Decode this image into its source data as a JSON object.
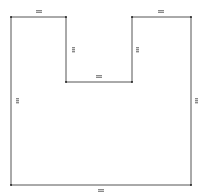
{
  "diagram": {
    "type": "floor-plan-outline",
    "shape": "U-shaped polygon",
    "stroke_color": "#555555",
    "vertex_color": "#222222",
    "label_color": "#888888",
    "vertices": [
      {
        "x": 11,
        "y": 17
      },
      {
        "x": 66,
        "y": 17
      },
      {
        "x": 66,
        "y": 82
      },
      {
        "x": 132,
        "y": 82
      },
      {
        "x": 132,
        "y": 17
      },
      {
        "x": 191,
        "y": 17
      },
      {
        "x": 191,
        "y": 185
      },
      {
        "x": 11,
        "y": 185
      }
    ],
    "dimension_labels": [
      {
        "id": "top-left",
        "text": "",
        "x": 39,
        "y": 11,
        "orient": "h"
      },
      {
        "id": "inner-left",
        "text": "",
        "x": 73,
        "y": 50,
        "orient": "v"
      },
      {
        "id": "inner-bottom",
        "text": "",
        "x": 99,
        "y": 76,
        "orient": "h"
      },
      {
        "id": "inner-right",
        "text": "",
        "x": 137,
        "y": 50,
        "orient": "v"
      },
      {
        "id": "top-right",
        "text": "",
        "x": 161,
        "y": 11,
        "orient": "h"
      },
      {
        "id": "left",
        "text": "",
        "x": 17,
        "y": 101,
        "orient": "v"
      },
      {
        "id": "right",
        "text": "",
        "x": 196,
        "y": 101,
        "orient": "v"
      },
      {
        "id": "bottom",
        "text": "",
        "x": 101,
        "y": 190,
        "orient": "h"
      }
    ]
  }
}
